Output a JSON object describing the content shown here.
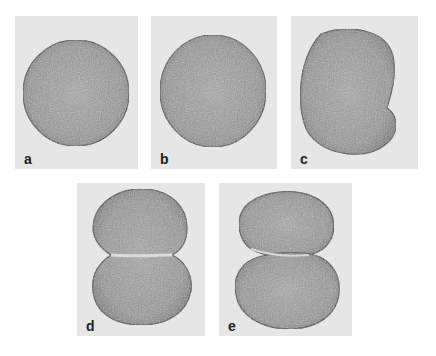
{
  "figure": {
    "colors": {
      "background": "#ffffff",
      "panel": "#e6e6e6",
      "cell_fill": "#9a9a9a",
      "cell_edge": "#3a3a3a"
    },
    "panels": [
      {
        "id": "a",
        "label": "a",
        "shape": "sphere"
      },
      {
        "id": "b",
        "label": "b",
        "shape": "sphere"
      },
      {
        "id": "c",
        "label": "c",
        "shape": "elongated-with-notch"
      },
      {
        "id": "d",
        "label": "d",
        "shape": "dumbbell-cleavage-furrow"
      },
      {
        "id": "e",
        "label": "e",
        "shape": "two-cells-nearly-divided"
      }
    ]
  }
}
